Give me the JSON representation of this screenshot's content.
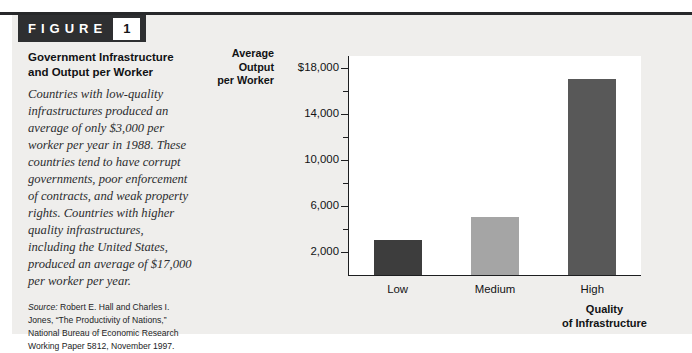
{
  "figure": {
    "label_word": "FIGURE",
    "number": "1",
    "title": "Government Infrastructure and Output per Worker",
    "caption": "Countries with low-quality infrastructures produced an average of only $3,000 per worker per year in 1988. These countries tend to have corrupt governments, poor enforcement of contracts, and weak property rights. Countries with higher quality infrastructures, including the United States, produced an average of $17,000 per worker per year.",
    "source_label": "Source:",
    "source_text": " Robert E. Hall and Charles I. Jones, “The Productivity of Nations,” National Bureau of Economic Research Working Paper 5812, November 1997."
  },
  "colors": {
    "panel_background": "#efeeec",
    "plot_background": "#ffffff",
    "header_background": "#2e2f31",
    "header_text": "#ffffff",
    "axis": "#1d1e20",
    "bar_low": "#3d3d3d",
    "bar_medium": "#a5a5a5",
    "bar_high": "#585858"
  },
  "chart_data": {
    "type": "bar",
    "title": "Government Infrastructure and Output per Worker",
    "xlabel": "Quality of Infrastructure",
    "ylabel": "Average Output per Worker",
    "categories": [
      "Low",
      "Medium",
      "High"
    ],
    "values": [
      3000,
      5000,
      17000
    ],
    "bar_colors": [
      "#3d3d3d",
      "#a5a5a5",
      "#585858"
    ],
    "ylim": [
      0,
      19000
    ],
    "y_major_ticks": [
      18000,
      14000,
      10000,
      6000,
      2000
    ],
    "y_minor_ticks": [
      16000,
      12000,
      8000,
      4000
    ],
    "y_tick_labels": [
      "$18,000",
      "14,000",
      "10,000",
      "6,000",
      "2,000"
    ],
    "grid": false,
    "legend": "none",
    "axis_lines": [
      "left",
      "bottom"
    ]
  },
  "axis_titles": {
    "y_line1": "Average",
    "y_line2": "Output",
    "y_line3": "per Worker",
    "x_line1": "Quality",
    "x_line2": "of Infrastructure"
  }
}
